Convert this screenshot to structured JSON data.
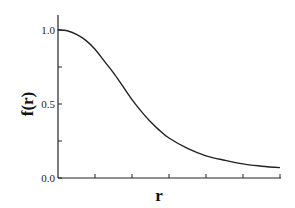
{
  "chart_data": {
    "type": "line",
    "title": "",
    "xlabel": "r",
    "ylabel": "f(r)",
    "xlim": [
      0,
      6
    ],
    "ylim": [
      0,
      1.1
    ],
    "x_ticks": [
      0,
      1,
      2,
      3,
      4,
      5,
      6
    ],
    "x_tick_labels": [],
    "y_ticks": [
      0.0,
      0.25,
      0.5,
      0.75,
      1.0
    ],
    "y_tick_labels": [
      "0.0",
      "",
      "0.5",
      "",
      "1.0"
    ],
    "grid": false,
    "legend": null,
    "series": [
      {
        "name": "f(r)",
        "color": "#222222",
        "x": [
          0,
          0.25,
          0.5,
          0.75,
          1.0,
          1.25,
          1.5,
          1.75,
          2.0,
          2.25,
          2.5,
          2.75,
          3.0,
          3.5,
          4.0,
          4.5,
          5.0,
          5.5,
          6.0
        ],
        "y": [
          1.0,
          0.995,
          0.97,
          0.93,
          0.87,
          0.79,
          0.71,
          0.62,
          0.53,
          0.45,
          0.38,
          0.32,
          0.27,
          0.2,
          0.15,
          0.12,
          0.095,
          0.08,
          0.07
        ]
      }
    ]
  }
}
